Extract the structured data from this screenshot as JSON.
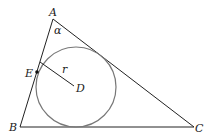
{
  "diagram": {
    "type": "geometry",
    "vertices": {
      "A": {
        "label": "A",
        "x": 53,
        "y": 19
      },
      "B": {
        "label": "B",
        "x": 20,
        "y": 127
      },
      "C": {
        "label": "C",
        "x": 194,
        "y": 127
      }
    },
    "incircle": {
      "center_label": "D",
      "cx": 76,
      "cy": 87,
      "r": 40
    },
    "tangent_point": {
      "label": "E",
      "x": 37,
      "y": 72
    },
    "radius_label": "r",
    "angle_label": "α",
    "colors": {
      "triangle": "#222222",
      "circle": "#777777",
      "point": "#111111"
    }
  }
}
